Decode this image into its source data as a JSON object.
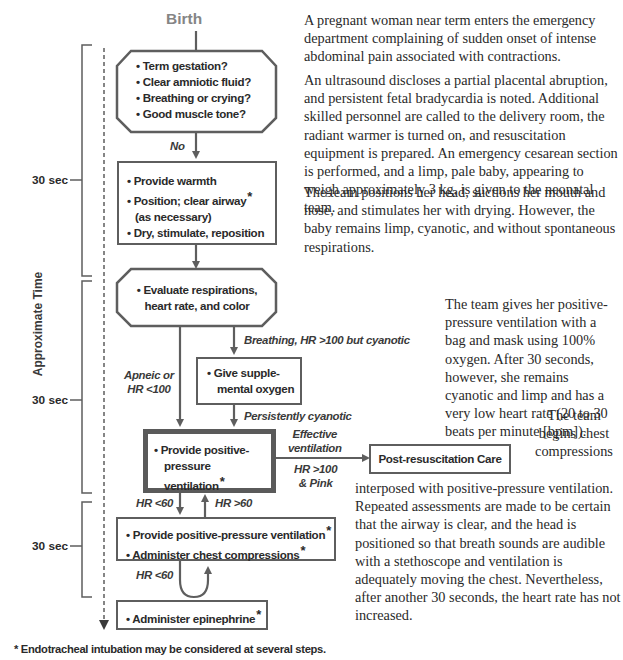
{
  "flowchart": {
    "start_label": "Birth",
    "time_axis_label": "Approximate Time",
    "time_intervals": [
      "30 sec",
      "30 sec",
      "30 sec"
    ],
    "assessment_box": {
      "items": [
        "Term gestation?",
        "Clear amniotic fluid?",
        "Breathing or crying?",
        "Good muscle tone?"
      ]
    },
    "no_label": "No",
    "initial_steps_box": {
      "items": [
        "Provide warmth",
        "Position; clear airway",
        "(as necessary)",
        "Dry, stimulate, reposition"
      ],
      "asterisk": "*"
    },
    "evaluate_box": {
      "line1": "Evaluate respirations,",
      "line2": "heart rate, and color"
    },
    "breathing_label": "Breathing, HR >100 but cyanotic",
    "apneic_label_line1": "Apneic or",
    "apneic_label_line2": "HR <100",
    "oxygen_box": {
      "line1": "Give supple-",
      "line2": "mental oxygen"
    },
    "persistently_cyanotic_label": "Persistently cyanotic",
    "ppv_box": {
      "line1": "Provide positive-",
      "line2": "pressure ventilation",
      "asterisk": "*"
    },
    "effective_label_line1": "Effective",
    "effective_label_line2": "ventilation",
    "hr100_label_line1": "HR >100",
    "hr100_label_line2": "& Pink",
    "post_care_box": "Post-resuscitation Care",
    "hr_lt60_label": "HR <60",
    "hr_gt60_label": "HR >60",
    "ppv_compressions_box": {
      "line1": "Provide positive-pressure ventilation",
      "line2": "Administer chest compressions",
      "asterisk": "*"
    },
    "hr_lt60_label_2": "HR <60",
    "epinephrine_box": {
      "label": "Administer epinephrine",
      "asterisk": "*"
    },
    "footnote": "* Endotracheal intubation may be considered at several steps.",
    "bullet": "•",
    "colors": {
      "line": "#5e5e5e",
      "text": "#2a2a2a",
      "label_gray": "#8a8a8a"
    }
  },
  "case_text": {
    "p1": "A pregnant woman near term enters the emergency department complaining of sudden onset of intense abdominal pain associated with contractions.",
    "p2": "An ultrasound discloses a partial placental abruption, and persistent fetal bradycardia is noted. Additional skilled personnel are called to the delivery room, the radiant warmer is turned on, and resuscitation equipment is prepared. An emergency cesarean section is performed, and a limp, pale baby, appearing to weigh approximately 3 kg, is given to the neonatal team.",
    "p3": "The team positions her head, suctions her mouth and nose, and stimulates her with drying. However, the baby remains limp, cyanotic, and without spontaneous respirations.",
    "p4": "The team gives her positive-pressure ventilation with a bag and mask using 100% oxygen. After 30 seconds, however, she remains cyanotic and limp and has a very low heart rate (20 to 30 beats per minute [bpm]).",
    "p5_narrow": "The team begins chest compressions",
    "p5_rest": "interposed with positive-pressure ventilation. Repeated assessments are made to be certain that the airway is clear, and the head is positioned so that breath sounds are audible with a stethoscope and ventilation is adequately moving the chest. Nevertheless, after another 30 seconds, the heart rate has not increased."
  }
}
